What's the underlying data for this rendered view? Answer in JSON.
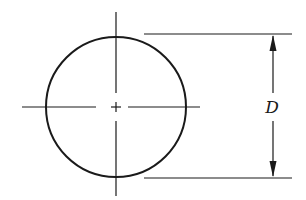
{
  "diagram": {
    "title": "",
    "type": "circle-diameter-dimension",
    "dimension_label": "D",
    "elements": [
      "circle",
      "vertical-centerline",
      "horizontal-centerline",
      "center-mark",
      "top-extension-line",
      "bottom-extension-line",
      "diameter-dimension-line"
    ],
    "colors": {
      "line": "#1a1a1a",
      "background": "#ffffff"
    }
  }
}
